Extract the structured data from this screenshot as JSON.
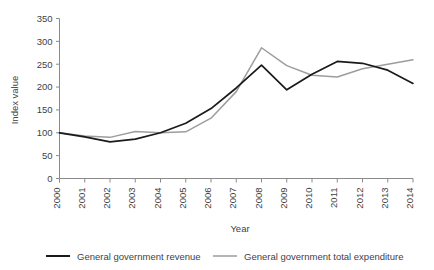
{
  "chart_data": {
    "type": "line",
    "title": "",
    "xlabel": "Year",
    "ylabel": "Index value",
    "categories": [
      "2000",
      "2001",
      "2002",
      "2003",
      "2004",
      "2005",
      "2006",
      "2007",
      "2008",
      "2009",
      "2010",
      "2011",
      "2012",
      "2013",
      "2014"
    ],
    "ylim": [
      0,
      350
    ],
    "yticks": [
      0,
      50,
      100,
      150,
      200,
      250,
      300,
      350
    ],
    "grid": false,
    "legend_position": "bottom",
    "series": [
      {
        "name": "General government revenue",
        "color": "#1a1a1a",
        "values": [
          100,
          91,
          80,
          86,
          100,
          121,
          153,
          198,
          248,
          194,
          228,
          256,
          252,
          237,
          208
        ]
      },
      {
        "name": "General government total expenditure",
        "color": "#9d9d9d",
        "values": [
          100,
          93,
          90,
          103,
          100,
          102,
          132,
          190,
          286,
          247,
          226,
          222,
          240,
          250,
          260
        ]
      }
    ]
  },
  "axes": {
    "y_title": "Index value",
    "x_title": "Year"
  },
  "legend": {
    "items": [
      {
        "label": "General government revenue",
        "color": "#1a1a1a"
      },
      {
        "label": "General government total expenditure",
        "color": "#9d9d9d"
      }
    ]
  }
}
